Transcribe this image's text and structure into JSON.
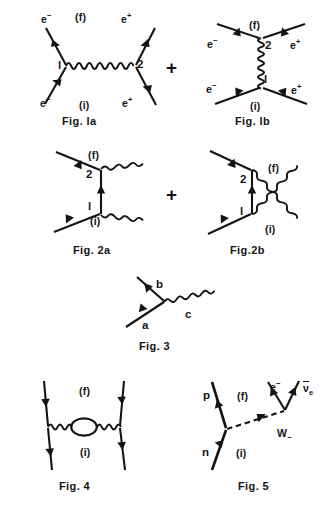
{
  "page": {
    "background": "#ffffff",
    "ink": "#141414",
    "width": 336,
    "height": 518
  },
  "operators": {
    "plus_row1": "+",
    "plus_row2": "+"
  },
  "figures": [
    {
      "id": "fig1a",
      "caption": "Fig. la",
      "description": "electron-positron annihilation s-channel with horizontal photon",
      "labels": {
        "electron_top_left": "e",
        "electron_top_left_charge": "−",
        "positron_top_right": "e",
        "positron_top_right_charge": "+",
        "electron_bottom_left": "e",
        "electron_bottom_left_charge": "−",
        "positron_bottom_right": "e",
        "positron_bottom_right_charge": "+",
        "final_state": "(f)",
        "initial_state": "(i)",
        "vertex_left": "l",
        "vertex_right": "2"
      }
    },
    {
      "id": "fig1b",
      "caption": "Fig. lb",
      "description": "electron-positron scattering t-channel with vertical photon",
      "labels": {
        "electron_top_left": "e",
        "electron_top_left_charge": "−",
        "positron_top_right": "e",
        "positron_top_right_charge": "+",
        "electron_bottom_left": "e",
        "electron_bottom_left_charge": "−",
        "positron_bottom_right": "e",
        "positron_bottom_right_charge": "+",
        "final_state": "(f)",
        "initial_state": "(i)",
        "vertex_top": "2",
        "vertex_bottom": "l"
      }
    },
    {
      "id": "fig2a",
      "caption": "Fig. 2a",
      "description": "Compton scattering direct channel, vertical fermion propagator",
      "labels": {
        "final_state": "(f)",
        "initial_state": "(i)",
        "vertex_top": "2",
        "vertex_bottom": "l"
      }
    },
    {
      "id": "fig2b",
      "caption": "Fig.2b",
      "description": "Compton scattering crossed channel with crossing photon lines",
      "labels": {
        "final_state": "(f)",
        "initial_state": "(i)",
        "vertex_top": "2",
        "vertex_bottom": "l"
      }
    },
    {
      "id": "fig3",
      "caption": "Fig. 3",
      "description": "single QED vertex with incoming fermion a, outgoing fermion b, photon c",
      "labels": {
        "incoming": "a",
        "outgoing": "b",
        "photon": "c"
      }
    },
    {
      "id": "fig4",
      "caption": "Fig. 4",
      "description": "scattering with vacuum polarization loop on the photon propagator",
      "labels": {
        "final_state": "(f)",
        "initial_state": "(i)"
      }
    },
    {
      "id": "fig5",
      "caption": "Fig. 5",
      "description": "neutron beta decay via W boson exchange",
      "labels": {
        "proton": "p",
        "neutron": "n",
        "final_state": "(f)",
        "initial_state": "(i)",
        "electron": "e",
        "electron_charge": "−",
        "antineutrino_symbol": "ν",
        "antineutrino_subscript": "e",
        "boson": "W",
        "boson_charge": "−"
      }
    }
  ]
}
